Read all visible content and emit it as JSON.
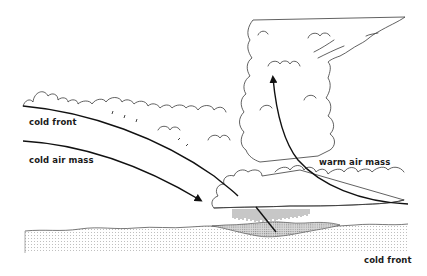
{
  "diagram": {
    "labels": {
      "cold_front_upper": "cold front",
      "cold_air_mass": "cold air mass",
      "warm_air_mass": "warm air mass",
      "cold_front_lower": "cold front"
    },
    "elements": [
      {
        "name": "cold-front-boundary",
        "type": "curve",
        "description": "upper curved line of the cold front sloping down to the right"
      },
      {
        "name": "cold-air-arrow",
        "type": "arrow",
        "direction": "down-right"
      },
      {
        "name": "warm-air-arrow",
        "type": "arrow",
        "direction": "up"
      },
      {
        "name": "cumulonimbus-cloud",
        "type": "cloud",
        "description": "tall storm cloud with anvil top"
      },
      {
        "name": "stratocumulus-band",
        "type": "cloud",
        "description": "cloud line along top of cold front"
      },
      {
        "name": "rain-shaft",
        "type": "precipitation"
      },
      {
        "name": "ground-surface",
        "type": "terrain",
        "pattern": "dotted"
      },
      {
        "name": "wet-ground",
        "type": "terrain",
        "pattern": "cross-hatched"
      }
    ],
    "colors": {
      "line": "#111111",
      "cloud_outline": "#3a3a3a",
      "ground_dots": "#9a9a9a",
      "background": "#ffffff"
    }
  }
}
